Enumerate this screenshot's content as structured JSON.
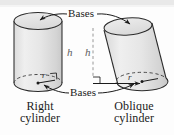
{
  "figure": {
    "type": "geometry-diagram",
    "background_color": "#fdfdfd",
    "ink_color": "#2b2b2b",
    "body_fill_color": "#e3e3e3",
    "labels": {
      "bases_top": "Bases",
      "bases_bottom": "Bases",
      "height_right": "h",
      "height_oblique": "h",
      "radius_right": "r",
      "radius_oblique": "r"
    },
    "captions": {
      "left_line1": "Right",
      "left_line2": "cylinder",
      "right_line1": "Oblique",
      "right_line2": "cylinder"
    },
    "solids": [
      {
        "name": "right-cylinder",
        "caption": "Right cylinder",
        "axis": "perpendicular to bases",
        "height_label": "h",
        "radius_label": "r",
        "has_right_angle_mark": true
      },
      {
        "name": "oblique-cylinder",
        "caption": "Oblique cylinder",
        "axis": "slanted relative to bases",
        "height_label": "h",
        "radius_label": "r",
        "has_right_angle_mark": true,
        "height_line_style": "dashed"
      }
    ]
  }
}
